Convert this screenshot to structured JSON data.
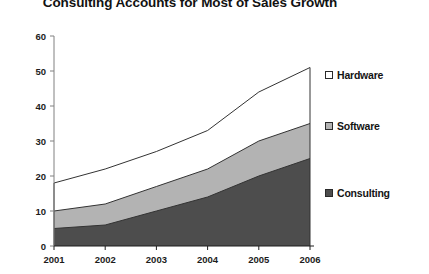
{
  "chart_data": {
    "type": "area",
    "stacked": true,
    "title": "Consulting Accounts for Most of Sales Growth",
    "xlabel": "",
    "ylabel": "",
    "categories": [
      "2001",
      "2002",
      "2003",
      "2004",
      "2005",
      "2006"
    ],
    "x": [
      2001,
      2002,
      2003,
      2004,
      2005,
      2006
    ],
    "series": [
      {
        "name": "Consulting",
        "color": "#4d4d4d",
        "values": [
          5,
          6,
          10,
          14,
          20,
          25
        ]
      },
      {
        "name": "Software",
        "color": "#b3b3b3",
        "values": [
          5,
          6,
          7,
          8,
          10,
          10
        ]
      },
      {
        "name": "Hardware",
        "color": "#ffffff",
        "values": [
          8,
          10,
          10,
          11,
          14,
          16
        ]
      }
    ],
    "cumulative_tops": {
      "Consulting": [
        5,
        6,
        10,
        14,
        20,
        25
      ],
      "Software": [
        10,
        12,
        17,
        22,
        30,
        35
      ],
      "Hardware": [
        18,
        22,
        27,
        33,
        44,
        51
      ]
    },
    "ylim": [
      0,
      60
    ],
    "yticks": [
      0,
      10,
      20,
      30,
      40,
      50,
      60
    ],
    "ytick_labels": [
      "0",
      "10",
      "20",
      "30",
      "40",
      "50",
      "60"
    ],
    "xtick_labels": [
      "2001",
      "2002",
      "2003",
      "2004",
      "2005",
      "2006"
    ],
    "grid": false,
    "legend_position": "right",
    "legend": [
      {
        "label": "Hardware",
        "color": "#ffffff"
      },
      {
        "label": "Software",
        "color": "#b3b3b3"
      },
      {
        "label": "Consulting",
        "color": "#4d4d4d"
      }
    ],
    "axis_color": "#808080",
    "line_color": "#333333"
  }
}
